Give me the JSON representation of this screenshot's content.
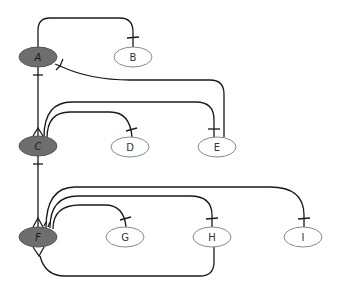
{
  "diagram": {
    "type": "crows-foot-relationship-diagram",
    "colors": {
      "parent_fill": "#6e6e6e",
      "child_fill": "#ffffff",
      "edge": "#1a1a1a"
    },
    "nodes": [
      {
        "id": "A",
        "label": "A",
        "kind": "parent",
        "cx": 38,
        "cy": 57
      },
      {
        "id": "B",
        "label": "B",
        "kind": "child",
        "cx": 133,
        "cy": 57
      },
      {
        "id": "C",
        "label": "C",
        "kind": "parent",
        "cx": 38,
        "cy": 146
      },
      {
        "id": "D",
        "label": "D",
        "kind": "child",
        "cx": 130,
        "cy": 147
      },
      {
        "id": "E",
        "label": "E",
        "kind": "child",
        "cx": 217,
        "cy": 147
      },
      {
        "id": "F",
        "label": "F",
        "kind": "parent",
        "cx": 38,
        "cy": 237
      },
      {
        "id": "G",
        "label": "G",
        "kind": "child",
        "cx": 125,
        "cy": 237
      },
      {
        "id": "H",
        "label": "H",
        "kind": "child",
        "cx": 212,
        "cy": 237
      },
      {
        "id": "I",
        "label": "I",
        "kind": "child",
        "cx": 303,
        "cy": 237
      }
    ],
    "edges": [
      {
        "from": "A",
        "to": "B"
      },
      {
        "from": "A",
        "to": "C"
      },
      {
        "from": "E",
        "to": "A"
      },
      {
        "from": "C",
        "to": "D"
      },
      {
        "from": "C",
        "to": "E"
      },
      {
        "from": "C",
        "to": "F"
      },
      {
        "from": "F",
        "to": "G"
      },
      {
        "from": "F",
        "to": "H"
      },
      {
        "from": "F",
        "to": "I"
      },
      {
        "from": "H",
        "to": "F"
      }
    ]
  }
}
